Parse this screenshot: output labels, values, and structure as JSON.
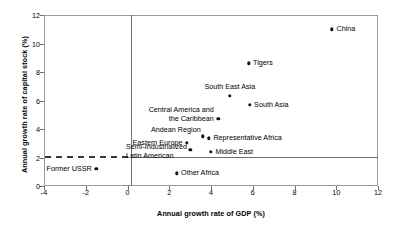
{
  "chart_data": {
    "type": "scatter",
    "title": "",
    "xlabel": "Annual growth rate of GDP (%)",
    "ylabel": "Annual growth rate of capital stock (%)",
    "xlim": [
      -4,
      12
    ],
    "ylim": [
      0,
      12
    ],
    "xticks": [
      "-4",
      "-2",
      "0",
      "2",
      "4",
      "6",
      "8",
      "10",
      "12"
    ],
    "xtick_values": [
      -4,
      -2,
      0,
      2,
      4,
      6,
      8,
      10,
      12
    ],
    "yticks": [
      "0",
      "2",
      "4",
      "6",
      "8",
      "10",
      "12"
    ],
    "ytick_values": [
      0,
      2,
      4,
      6,
      8,
      10,
      12
    ],
    "grid": false,
    "legend": "none",
    "reference_lines": [
      {
        "name": "vertical-zero-line",
        "orientation": "vertical",
        "value": 0,
        "style": "solid"
      },
      {
        "name": "horizontal-two-line-solid",
        "orientation": "horizontal",
        "value": 2,
        "style": "solid",
        "from_x": 0,
        "to_x": 12
      },
      {
        "name": "horizontal-two-line-dashed",
        "orientation": "horizontal",
        "value": 2,
        "style": "dashed",
        "from_x": -4,
        "to_x": 0
      }
    ],
    "points": [
      {
        "label": "China",
        "x": 9.8,
        "y": 11.0,
        "label_pos": "right"
      },
      {
        "label": "Tigers",
        "x": 5.8,
        "y": 8.6,
        "label_pos": "right"
      },
      {
        "label": "South East Asia",
        "x": 4.9,
        "y": 6.35,
        "label_pos": "above"
      },
      {
        "label": "South Asia",
        "x": 5.85,
        "y": 5.7,
        "label_pos": "right"
      },
      {
        "label": "Central America and\nthe Caribbean",
        "x": 4.35,
        "y": 4.7,
        "label_pos": "left-two"
      },
      {
        "label": "Andean Region",
        "x": 3.6,
        "y": 3.5,
        "label_pos": "above-left"
      },
      {
        "label": "Representative Africa",
        "x": 3.9,
        "y": 3.35,
        "label_pos": "right"
      },
      {
        "label": "Eastern Europe",
        "x": 2.85,
        "y": 3.05,
        "label_pos": "left"
      },
      {
        "label": "Semi-Industrialized\nLatin American",
        "x": 3.0,
        "y": 2.55,
        "label_pos": "left-two-stack"
      },
      {
        "label": "Middle East",
        "x": 4.0,
        "y": 2.4,
        "label_pos": "right"
      },
      {
        "label": "Former USSR",
        "x": -1.5,
        "y": 1.2,
        "label_pos": "left"
      },
      {
        "label": "Other Africa",
        "x": 2.35,
        "y": 0.9,
        "label_pos": "right"
      }
    ]
  },
  "labels": {
    "china": "China",
    "tigers": "Tigers",
    "south_east_asia": "South East Asia",
    "south_asia": "South Asia",
    "central_america_1": "Central America and",
    "central_america_2": "the Caribbean",
    "andean_region": "Andean Region",
    "representative_africa": "Representative Africa",
    "eastern_europe": "Eastern Europe",
    "semi_industrialized_1": "Semi-Industrialized",
    "semi_industrialized_2": "Latin American",
    "middle_east": "Middle East",
    "former_ussr": "Former USSR",
    "other_africa": "Other Africa"
  },
  "axes": {
    "x_title": "Annual growth rate of GDP (%)",
    "y_title": "Annual growth rate of capital stock (%)",
    "x_ticks": [
      "-4",
      "-2",
      "0",
      "2",
      "4",
      "6",
      "8",
      "10",
      "12"
    ],
    "y_ticks": [
      "0",
      "2",
      "4",
      "6",
      "8",
      "10",
      "12"
    ]
  },
  "colors": {
    "marker": "#111111",
    "frame": "#9a9a9a",
    "reference_line": "#6f6f6f",
    "dashed_line": "#3a3a3a",
    "text": "#000000",
    "background": "#ffffff"
  }
}
